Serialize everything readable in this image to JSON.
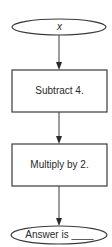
{
  "flowchart": {
    "start": {
      "label": "x",
      "shape": "ellipse"
    },
    "steps": [
      {
        "label": "Subtract 4.",
        "shape": "rectangle"
      },
      {
        "label": "Multiply by 2.",
        "shape": "rectangle"
      }
    ],
    "end": {
      "label": "Answer is ____",
      "shape": "ellipse"
    },
    "colors": {
      "stroke": "#3a3a3a",
      "text": "#2a2a2a",
      "background": "#ffffff"
    }
  }
}
